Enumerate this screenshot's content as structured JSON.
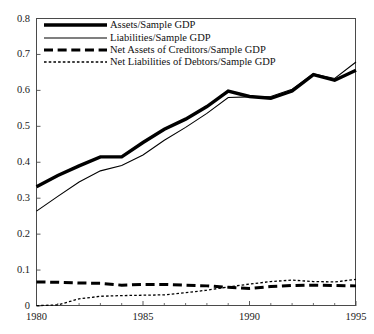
{
  "chart_data": {
    "type": "line",
    "title": "",
    "subtitle": "",
    "xlabel": "",
    "ylabel": "",
    "xlim": [
      1980,
      1995
    ],
    "ylim": [
      0,
      0.8
    ],
    "grid": false,
    "legend_position": "top-left",
    "x": [
      1980,
      1981,
      1982,
      1983,
      1984,
      1985,
      1986,
      1987,
      1988,
      1989,
      1990,
      1991,
      1992,
      1993,
      1994,
      1995
    ],
    "x_tick_labels": [
      "1980",
      "1985",
      "1990",
      "1995"
    ],
    "x_tick_values": [
      1980,
      1985,
      1990,
      1995
    ],
    "x_minor_ticks": [
      1981,
      1982,
      1983,
      1984,
      1986,
      1987,
      1988,
      1989,
      1991,
      1992,
      1993,
      1994
    ],
    "y_tick_labels": [
      "0",
      "0.1",
      "0.2",
      "0.3",
      "0.4",
      "0.5",
      "0.6",
      "0.7",
      "0.8"
    ],
    "y_tick_values": [
      0,
      0.1,
      0.2,
      0.3,
      0.4,
      0.5,
      0.6,
      0.7,
      0.8
    ],
    "series": [
      {
        "name": "Assets/Sample GDP",
        "style": "solid-thick",
        "color": "#000000",
        "width": 3.4,
        "values": [
          0.332,
          0.363,
          0.39,
          0.415,
          0.415,
          0.455,
          0.492,
          0.52,
          0.555,
          0.598,
          0.583,
          0.578,
          0.598,
          0.644,
          0.628,
          0.656
        ]
      },
      {
        "name": "Liabilities/Sample GDP",
        "style": "solid-thin",
        "color": "#000000",
        "width": 1.1,
        "values": [
          0.264,
          0.305,
          0.345,
          0.376,
          0.391,
          0.42,
          0.461,
          0.497,
          0.536,
          0.58,
          0.582,
          0.583,
          0.603,
          0.646,
          0.633,
          0.679
        ]
      },
      {
        "name": "Net Assets of Creditors/Sample GDP",
        "style": "dashed-thick",
        "color": "#000000",
        "width": 3.0,
        "values": [
          0.067,
          0.066,
          0.064,
          0.063,
          0.058,
          0.06,
          0.06,
          0.058,
          0.056,
          0.052,
          0.049,
          0.054,
          0.057,
          0.058,
          0.057,
          0.056
        ]
      },
      {
        "name": "Net Liabilities of Debtors/Sample GDP",
        "style": "dotted-thin",
        "color": "#000000",
        "width": 1.3,
        "values": [
          0.001,
          0.003,
          0.02,
          0.027,
          0.029,
          0.03,
          0.031,
          0.037,
          0.044,
          0.053,
          0.061,
          0.068,
          0.072,
          0.068,
          0.067,
          0.074
        ]
      }
    ]
  },
  "legend": {
    "items": [
      {
        "label": "Assets/Sample GDP",
        "style": "solid-thick"
      },
      {
        "label": "Liabilities/Sample GDP",
        "style": "solid-thin"
      },
      {
        "label": "Net Assets of Creditors/Sample GDP",
        "style": "dashed-thick"
      },
      {
        "label": "Net Liabilities of Debtors/Sample GDP",
        "style": "dotted-thin"
      }
    ]
  },
  "axes": {
    "frame_color": "#4a4a4a"
  }
}
